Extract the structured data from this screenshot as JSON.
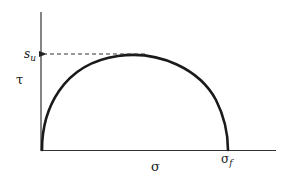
{
  "diagram": {
    "type": "mohr-circle-semicircle",
    "axes": {
      "y_label": "τ",
      "x_label": "σ"
    },
    "annotations": {
      "peak_label": "s",
      "peak_label_sub": "u",
      "end_label": "σ",
      "end_label_sub": "f"
    },
    "colors": {
      "stroke": "#1a1a1a",
      "axis": "#333333",
      "background": "#ffffff"
    }
  }
}
